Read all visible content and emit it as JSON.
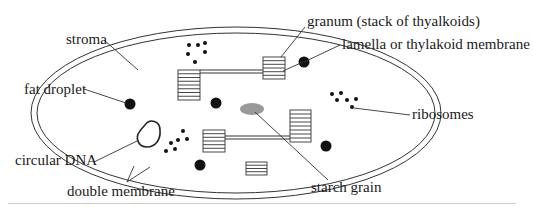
{
  "figure": {
    "labels": {
      "stroma": "stroma",
      "granum": "granum (stack of thyalkoids)",
      "lamella": "lamella or thylakoid membrane",
      "fat_droplet": "fat droplet",
      "ribosomes": "ribosomes",
      "circular_dna": "circular DNA",
      "starch_grain": "starch grain",
      "double_membrane": "double membrane"
    },
    "colors": {
      "line": "#333333",
      "fat_droplet": "#111111",
      "starch_grain": "#999999",
      "background": "#ffffff"
    }
  }
}
